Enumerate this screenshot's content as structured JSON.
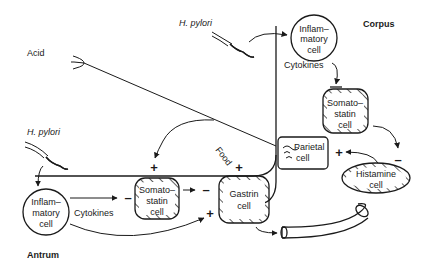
{
  "regions": {
    "corpus": "Corpus",
    "antrum": "Antrum"
  },
  "labels": {
    "acid": "Acid",
    "food": "Food",
    "h_pylori_top": "H. pylori",
    "h_pylori_left": "H. pylori",
    "cytokines_corpus": "Cytokines",
    "cytokines_antrum": "Cytokines"
  },
  "cells": {
    "inflammatory_corpus": [
      "Inflam–",
      "matory",
      "cell"
    ],
    "somatostatin_corpus": [
      "Somato–",
      "statin",
      "cell"
    ],
    "parietal": [
      "Parietal",
      "cell"
    ],
    "histamine": [
      "Histamine",
      "cell"
    ],
    "inflammatory_antrum": [
      "Inflam–",
      "matory",
      "cell"
    ],
    "somatostatin_antrum": [
      "Somato–",
      "statin",
      "cell"
    ],
    "gastrin": [
      "Gastrin",
      "cell"
    ]
  },
  "signs": {
    "food_to_somatostatin": "+",
    "food_to_gastrin": "+",
    "somatostatin_to_gastrin": "–",
    "cytokines_to_somatostatin_antrum": "–",
    "inflammatory_to_gastrin": "+",
    "somatostatin_to_histamine": "–",
    "histamine_to_parietal": "+"
  },
  "colors": {
    "ink": "#1a1a1a",
    "background": "#ffffff"
  }
}
